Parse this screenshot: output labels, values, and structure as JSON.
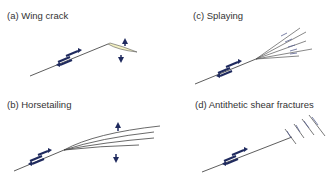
{
  "panels": [
    {
      "id": "a",
      "label": "(a) Wing crack"
    },
    {
      "id": "b",
      "label": "(b) Horsetailing"
    },
    {
      "id": "c",
      "label": "(c) Splaying"
    },
    {
      "id": "d",
      "label": "(d) Antithetic shear fractures"
    }
  ],
  "colors": {
    "fault_line": "#333333",
    "arrow": "#1f2a5e",
    "wing_fill": "#f4f2c4",
    "label_text": "#333333"
  }
}
